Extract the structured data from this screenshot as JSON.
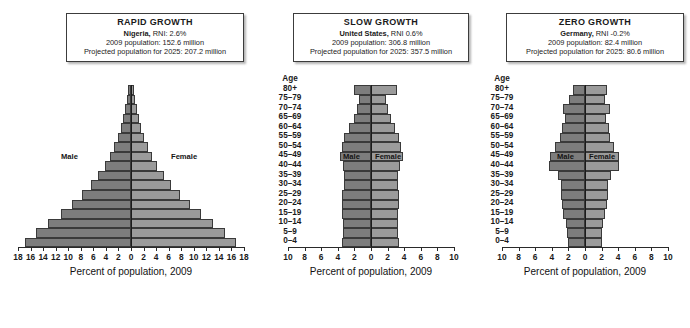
{
  "figure": {
    "axis_title": "Percent of population, 2009",
    "age_header": "Age",
    "male_label": "Male",
    "female_label": "Female",
    "male_color": "#7d7d7d",
    "female_color": "#9b9b9b",
    "outline_color": "#3a3a3a",
    "age_groups": [
      "80+",
      "75–79",
      "70–74",
      "65–69",
      "60–64",
      "55–59",
      "50–54",
      "45–49",
      "40–44",
      "35–39",
      "30–34",
      "25–29",
      "20–24",
      "15–19",
      "10–14",
      "5–9",
      "0–4"
    ]
  },
  "chart_data": [
    {
      "type": "bar",
      "title": "RAPID GROWTH",
      "country": "Nigeria,",
      "rni": "RNI: 2.6%",
      "population_line": "2009 population: 152.6 million",
      "projection_line": "Projected population for 2025: 207.2 million",
      "xlabel": "Percent of population, 2009",
      "ylabel": "Age",
      "xlim": [
        -18,
        18
      ],
      "xticks": [
        18,
        16,
        14,
        12,
        10,
        8,
        6,
        4,
        2,
        0,
        2,
        4,
        6,
        8,
        10,
        12,
        14,
        16,
        18
      ],
      "categories": [
        "80+",
        "75–79",
        "70–74",
        "65–69",
        "60–64",
        "55–59",
        "50–54",
        "45–49",
        "40–44",
        "35–39",
        "30–34",
        "25–29",
        "20–24",
        "15–19",
        "10–14",
        "5–9",
        "0–4"
      ],
      "series": [
        {
          "name": "Male",
          "values": [
            0.4,
            0.6,
            0.9,
            1.2,
            1.6,
            2.1,
            2.7,
            3.4,
            4.2,
            5.2,
            6.4,
            7.8,
            9.4,
            11.2,
            13.2,
            15.1,
            16.9
          ]
        },
        {
          "name": "Female",
          "values": [
            0.4,
            0.6,
            0.9,
            1.2,
            1.6,
            2.1,
            2.7,
            3.4,
            4.2,
            5.2,
            6.4,
            7.8,
            9.4,
            11.2,
            13.1,
            15.0,
            16.8
          ]
        }
      ]
    },
    {
      "type": "bar",
      "title": "SLOW GROWTH",
      "country": "United States,",
      "rni": "RNI 0.6%",
      "population_line": "2009 population: 306.8 million",
      "projection_line": "Projected population for 2025: 357.5 million",
      "xlabel": "Percent of population, 2009",
      "ylabel": "Age",
      "xlim": [
        -10,
        10
      ],
      "xticks": [
        10,
        8,
        6,
        4,
        2,
        0,
        2,
        4,
        6,
        8,
        10
      ],
      "categories": [
        "80+",
        "75–79",
        "70–74",
        "65–69",
        "60–64",
        "55–59",
        "50–54",
        "45–49",
        "40–44",
        "35–39",
        "30–34",
        "25–29",
        "20–24",
        "15–19",
        "10–14",
        "5–9",
        "0–4"
      ],
      "series": [
        {
          "name": "Male",
          "values": [
            2.0,
            1.4,
            1.7,
            2.1,
            2.6,
            3.2,
            3.5,
            3.7,
            3.4,
            3.3,
            3.3,
            3.5,
            3.5,
            3.5,
            3.4,
            3.4,
            3.5
          ]
        },
        {
          "name": "Female",
          "values": [
            3.1,
            1.8,
            2.1,
            2.4,
            2.9,
            3.4,
            3.6,
            3.8,
            3.5,
            3.3,
            3.2,
            3.4,
            3.4,
            3.3,
            3.2,
            3.2,
            3.4
          ]
        }
      ]
    },
    {
      "type": "bar",
      "title": "ZERO GROWTH",
      "country": "Germany,",
      "rni": "RNI -0.2%",
      "population_line": "2009 population: 82.4 million",
      "projection_line": "Projected population for 2025: 80.6 million",
      "xlabel": "Percent of population, 2009",
      "ylabel": "Age",
      "xlim": [
        -10,
        10
      ],
      "xticks": [
        10,
        8,
        6,
        4,
        2,
        0,
        2,
        4,
        6,
        8,
        10
      ],
      "categories": [
        "80+",
        "75–79",
        "70–74",
        "65–69",
        "60–64",
        "55–59",
        "50–54",
        "45–49",
        "40–44",
        "35–39",
        "30–34",
        "25–29",
        "20–24",
        "15–19",
        "10–14",
        "5–9",
        "0–4"
      ],
      "series": [
        {
          "name": "Male",
          "values": [
            1.5,
            1.9,
            2.6,
            2.4,
            2.8,
            3.0,
            3.6,
            4.2,
            4.3,
            3.3,
            2.9,
            2.9,
            2.8,
            2.6,
            2.3,
            2.2,
            2.1
          ]
        },
        {
          "name": "Female",
          "values": [
            2.6,
            2.4,
            3.0,
            2.5,
            2.9,
            3.0,
            3.5,
            4.1,
            4.1,
            3.1,
            2.8,
            2.8,
            2.6,
            2.4,
            2.2,
            2.1,
            2.0
          ]
        }
      ]
    }
  ]
}
